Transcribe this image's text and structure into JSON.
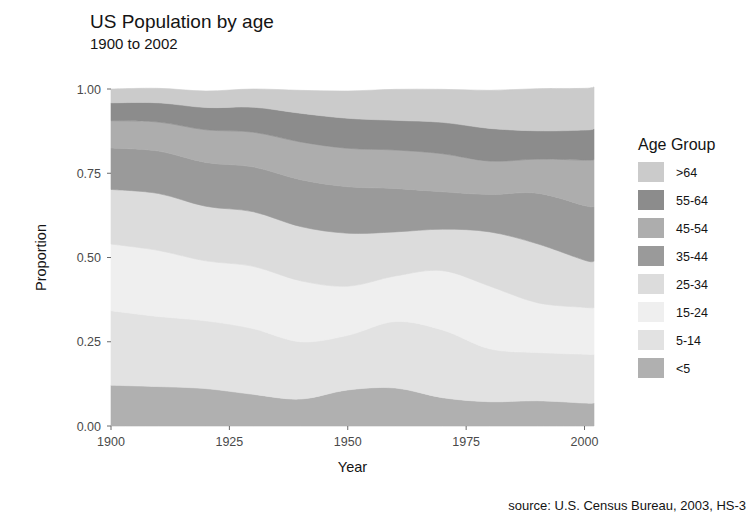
{
  "header": {
    "title": "US Population by age",
    "subtitle": "1900 to 2002"
  },
  "source": {
    "text": "source: U.S. Census Bureau, 2003, HS-3"
  },
  "legend": {
    "title": "Age Group",
    "position": "right"
  },
  "chart_data": {
    "type": "area",
    "stacked": true,
    "title": "US Population by age",
    "subtitle": "1900 to 2002",
    "xlabel": "Year",
    "ylabel": "Proportion",
    "xlim": [
      1900,
      2002
    ],
    "ylim": [
      0,
      1
    ],
    "grid": false,
    "legend_title": "Age Group",
    "legend_position": "right",
    "x_ticks": [
      1900,
      1925,
      1950,
      1975,
      2000
    ],
    "x_tick_labels": [
      "1900",
      "1925",
      "1950",
      "1975",
      "2000"
    ],
    "y_ticks": [
      0.0,
      0.25,
      0.5,
      0.75,
      1.0
    ],
    "y_tick_labels": [
      "0.00",
      "0.25",
      "0.50",
      "0.75",
      "1.00"
    ],
    "panel_background": "#ffffff",
    "x": [
      1900,
      1910,
      1920,
      1930,
      1940,
      1950,
      1960,
      1970,
      1980,
      1990,
      2000,
      2002
    ],
    "stack_order_bottom_to_top": [
      "<5",
      "5-14",
      "15-24",
      "25-34",
      "35-44",
      "45-54",
      "55-64",
      ">64"
    ],
    "series": [
      {
        "name": "<5",
        "color": "#b0b0b0",
        "values": [
          0.121,
          0.117,
          0.111,
          0.094,
          0.08,
          0.107,
          0.113,
          0.084,
          0.072,
          0.075,
          0.068,
          0.068
        ]
      },
      {
        "name": "5-14",
        "color": "#e2e2e2",
        "values": [
          0.221,
          0.208,
          0.201,
          0.195,
          0.17,
          0.162,
          0.197,
          0.201,
          0.157,
          0.143,
          0.145,
          0.144
        ]
      },
      {
        "name": "15-24",
        "color": "#efefef",
        "values": [
          0.198,
          0.196,
          0.178,
          0.185,
          0.181,
          0.146,
          0.135,
          0.176,
          0.186,
          0.148,
          0.139,
          0.139
        ]
      },
      {
        "name": "25-34",
        "color": "#dcdcdc",
        "values": [
          0.162,
          0.169,
          0.162,
          0.162,
          0.161,
          0.157,
          0.131,
          0.123,
          0.161,
          0.175,
          0.14,
          0.138
        ]
      },
      {
        "name": "35-44",
        "color": "#9a9a9a",
        "values": [
          0.123,
          0.126,
          0.13,
          0.133,
          0.139,
          0.138,
          0.129,
          0.111,
          0.111,
          0.15,
          0.162,
          0.162
        ]
      },
      {
        "name": "45-54",
        "color": "#adadad",
        "values": [
          0.081,
          0.086,
          0.097,
          0.103,
          0.112,
          0.114,
          0.114,
          0.113,
          0.099,
          0.101,
          0.135,
          0.139
        ]
      },
      {
        "name": "55-64",
        "color": "#8c8c8c",
        "values": [
          0.053,
          0.057,
          0.066,
          0.074,
          0.085,
          0.089,
          0.088,
          0.093,
          0.097,
          0.084,
          0.089,
          0.092
        ]
      },
      {
        "name": ">64",
        "color": "#cbcbcb",
        "values": [
          0.041,
          0.043,
          0.049,
          0.054,
          0.068,
          0.081,
          0.092,
          0.098,
          0.113,
          0.125,
          0.124,
          0.124
        ]
      }
    ],
    "legend_entries": [
      {
        "label": ">64",
        "color": "#cbcbcb"
      },
      {
        "label": "55-64",
        "color": "#8c8c8c"
      },
      {
        "label": "45-54",
        "color": "#adadad"
      },
      {
        "label": "35-44",
        "color": "#9a9a9a"
      },
      {
        "label": "25-34",
        "color": "#dcdcdc"
      },
      {
        "label": "15-24",
        "color": "#efefef"
      },
      {
        "label": "5-14",
        "color": "#e2e2e2"
      },
      {
        "label": "<5",
        "color": "#b0b0b0"
      }
    ]
  }
}
